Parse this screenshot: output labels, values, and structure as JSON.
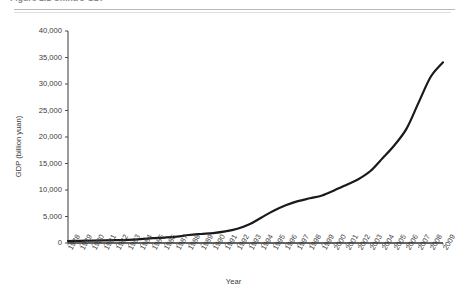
{
  "figure": {
    "caption": "Figure 1.1  China's GDP",
    "caption_visible": "partially cropped at top edge"
  },
  "chart_data": {
    "type": "line",
    "title": "",
    "xlabel": "Year",
    "ylabel": "GDP (billion yuan)",
    "xlim": [
      1978,
      2009
    ],
    "ylim": [
      0,
      40000
    ],
    "ytick_values": [
      0,
      5000,
      10000,
      15000,
      20000,
      25000,
      30000,
      35000,
      40000
    ],
    "ytick_labels": [
      "0",
      "5,000",
      "10,000",
      "15,000",
      "20,000",
      "25,000",
      "30,000",
      "35,000",
      "40,000"
    ],
    "grid": false,
    "legend": false,
    "legend_position": "none",
    "line_color": "#1a1a1a",
    "line_width": 2.2,
    "axis_color": "#4a4a4a",
    "categories": [
      "1978",
      "1979",
      "1980",
      "1981",
      "1982",
      "1983",
      "1984",
      "1985",
      "1986",
      "1987",
      "1988",
      "1989",
      "1990",
      "1991",
      "1992",
      "1993",
      "1994",
      "1995",
      "1996",
      "1997",
      "1998",
      "1999",
      "2000",
      "2001",
      "2002",
      "2003",
      "2004",
      "2005",
      "2006",
      "2007",
      "2008",
      "2009"
    ],
    "series": [
      {
        "name": "GDP (billion yuan)",
        "values": [
          364,
          406,
          454,
          489,
          532,
          596,
          720,
          901,
          1028,
          1206,
          1504,
          1699,
          1867,
          2179,
          2693,
          3533,
          4820,
          6079,
          7118,
          7897,
          8440,
          8968,
          9921,
          10966,
          12033,
          13582,
          15988,
          18494,
          21631,
          26581,
          31405,
          34090
        ]
      }
    ]
  }
}
